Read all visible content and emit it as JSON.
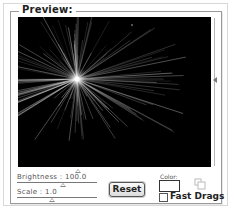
{
  "group": {
    "title": "Preview:"
  },
  "preview": {
    "description": "starburst light flare on black background",
    "vertical_slider_value_pct": 41,
    "horizontal_slider_value_pct": 32
  },
  "brightness": {
    "label": "Brightness : 100.0",
    "value": 100.0,
    "slider_pct": 45
  },
  "scale": {
    "label": "Scale : 1.0",
    "value": 1.0,
    "slider_pct": 30
  },
  "buttons": {
    "reset_label": "Reset"
  },
  "color": {
    "label": "Color:",
    "value": "#ffffff"
  },
  "fast_drags": {
    "label": "Fast Drags",
    "checked": false
  }
}
